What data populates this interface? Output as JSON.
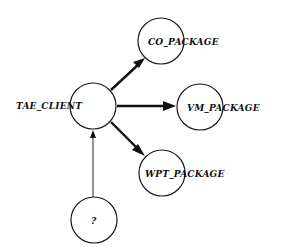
{
  "diagram": {
    "type": "dependency-graph",
    "nodes": [
      {
        "id": "client",
        "label": "TAE_CLIENT"
      },
      {
        "id": "co",
        "label": "CO_PACKAGE"
      },
      {
        "id": "vm",
        "label": "VM_PACKAGE"
      },
      {
        "id": "wpt",
        "label": "WPT_PACKAGE"
      },
      {
        "id": "unknown",
        "label": "?"
      }
    ],
    "edges": [
      {
        "from": "client",
        "to": "co",
        "style": "thick"
      },
      {
        "from": "client",
        "to": "vm",
        "style": "thick"
      },
      {
        "from": "client",
        "to": "wpt",
        "style": "thick"
      },
      {
        "from": "unknown",
        "to": "client",
        "style": "thin"
      }
    ]
  }
}
